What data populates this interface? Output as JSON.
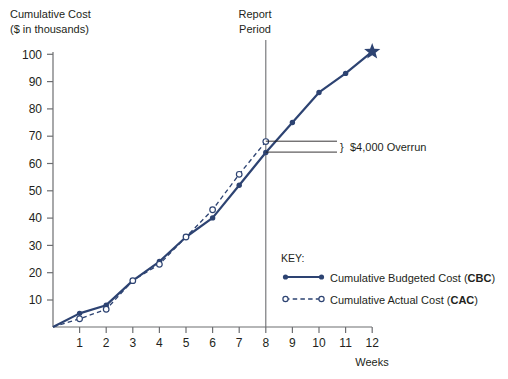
{
  "chart_data": {
    "type": "line",
    "title": "Cumulative Cost",
    "subtitle": "($ in thousands)",
    "xlabel": "Weeks",
    "ylabel": "Cumulative Cost ($ in thousands)",
    "xlim": [
      0,
      12
    ],
    "ylim": [
      0,
      100
    ],
    "grid": false,
    "legend_position": "inside-bottom-right",
    "legend_title": "KEY:",
    "x": [
      0,
      1,
      2,
      3,
      4,
      5,
      6,
      7,
      8,
      9,
      10,
      11,
      12
    ],
    "xticks": [
      "1",
      "2",
      "3",
      "4",
      "5",
      "6",
      "7",
      "8",
      "9",
      "10",
      "11",
      "12"
    ],
    "yticks": [
      "10",
      "20",
      "30",
      "40",
      "50",
      "60",
      "70",
      "80",
      "90",
      "100"
    ],
    "series": [
      {
        "name": "Cumulative Budgeted Cost (CBC)",
        "label_plain": "Cumulative Budgeted Cost (",
        "label_abbr": "CBC",
        "label_tail": ")",
        "style": "solid",
        "marker": "filled-circle",
        "end_marker": "star",
        "color": "#2d4372",
        "x": [
          0,
          1,
          2,
          3,
          4,
          5,
          6,
          7,
          8,
          9,
          10,
          11,
          12
        ],
        "values": [
          0,
          5,
          8,
          17,
          24,
          33,
          40,
          52,
          64,
          75,
          86,
          93,
          101
        ]
      },
      {
        "name": "Cumulative Actual Cost (CAC)",
        "label_plain": "Cumulative Actual Cost (",
        "label_abbr": "CAC",
        "label_tail": ")",
        "style": "dashed",
        "marker": "open-circle",
        "color": "#2d4372",
        "x": [
          0,
          1,
          2,
          3,
          4,
          5,
          6,
          7,
          8
        ],
        "values": [
          0,
          3,
          6.5,
          17,
          23,
          33,
          43,
          56,
          68
        ]
      }
    ],
    "annotations": [
      {
        "name": "report-period",
        "text_line1": "Report",
        "text_line2": "Period",
        "type": "vertical-line",
        "x": 8
      },
      {
        "name": "overrun",
        "text": "$4,000 Overrun",
        "brace": "}",
        "type": "brace",
        "x": 8,
        "y_from": 64,
        "y_to": 68,
        "amount": 4000
      }
    ]
  },
  "axes": {
    "title_line1": "Cumulative Cost",
    "title_line2": "($ in thousands)",
    "x_axis_name": "Weeks"
  }
}
